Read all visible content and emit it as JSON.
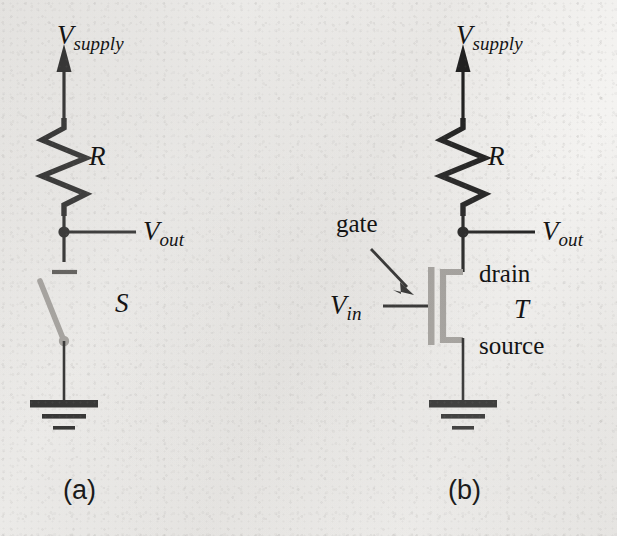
{
  "figure": {
    "ink_color": "#141414",
    "device_color": "#9d9a96",
    "background_color": "#f3f2f0"
  },
  "panel_a": {
    "caption": "(a)",
    "supply_label": {
      "symbol": "V",
      "subscript": "supply"
    },
    "resistor_label": "R",
    "out_label": {
      "symbol": "V",
      "subscript": "out"
    },
    "switch_label": "S",
    "components": [
      "supply-arrow",
      "resistor",
      "output-node",
      "switch",
      "ground"
    ]
  },
  "panel_b": {
    "caption": "(b)",
    "supply_label": {
      "symbol": "V",
      "subscript": "supply"
    },
    "resistor_label": "R",
    "out_label": {
      "symbol": "V",
      "subscript": "out"
    },
    "in_label": {
      "symbol": "V",
      "subscript": "in"
    },
    "transistor_label": "T",
    "gate_label": "gate",
    "drain_label": "drain",
    "source_label": "source",
    "components": [
      "supply-arrow",
      "resistor",
      "output-node",
      "mosfet",
      "gate-callout-arrow",
      "ground"
    ]
  }
}
